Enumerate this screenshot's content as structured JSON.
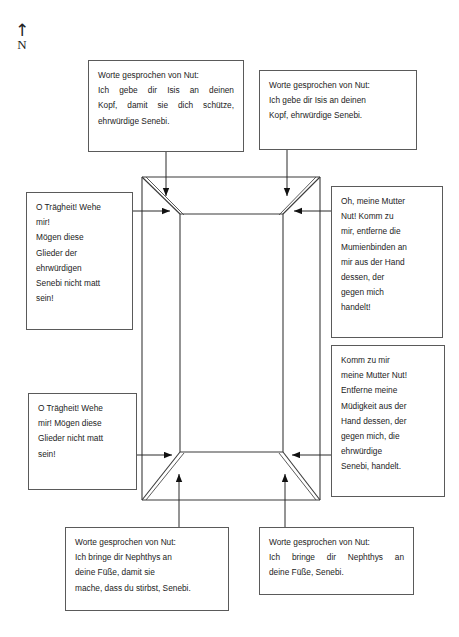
{
  "figure": {
    "compass": {
      "arrow_glyph": "↑",
      "label": "N"
    },
    "diagram_name": "coffin-schematic"
  },
  "notes": {
    "head_left": {
      "lines": [
        "Worte gesprochen von Nut:",
        "Ich gebe dir Isis an deinen",
        "Kopf, damit sie dich schütze,",
        "ehrwürdige Senebi."
      ]
    },
    "head_right": {
      "lines": [
        "Worte gesprochen von Nut:",
        "Ich gebe dir Isis an deinen",
        "Kopf, ehrwürdige Senebi."
      ]
    },
    "side_left_upper": {
      "lines": [
        "O Trägheit! Wehe",
        "mir!",
        "Mögen diese",
        "Glieder der",
        "ehrwürdigen",
        "Senebi nicht matt",
        "sein!"
      ]
    },
    "side_right_upper": {
      "lines": [
        "Oh, meine Mutter",
        "Nut! Komm zu",
        "mir, entferne die",
        "Mumienbinden an",
        "mir aus der Hand",
        "dessen, der",
        "gegen mich",
        "handelt!"
      ]
    },
    "side_left_lower": {
      "lines": [
        "O Trägheit! Wehe",
        "mir! Mögen diese",
        "Glieder nicht matt",
        "sein!"
      ]
    },
    "side_right_lower": {
      "lines": [
        "Komm zu mir",
        "meine Mutter Nut!",
        "Entferne meine",
        "Müdigkeit aus der",
        "Hand dessen, der",
        "gegen mich, die",
        "ehrwürdige",
        "Senebi, handelt."
      ]
    },
    "foot_left": {
      "lines": [
        "Worte gesprochen von Nut:",
        "Ich bringe dir Nephthys an",
        "deine Füße, damit sie",
        "mache, dass du stirbst, Senebi."
      ]
    },
    "foot_right": {
      "lines": [
        "Worte gesprochen von Nut:",
        "Ich bringe dir Nephthys an",
        "deine Füße, Senebi."
      ]
    }
  },
  "colors": {
    "line": "#3a3a3a",
    "text": "#1c1c1c",
    "border": "#5a5a5a",
    "background": "#ffffff"
  }
}
